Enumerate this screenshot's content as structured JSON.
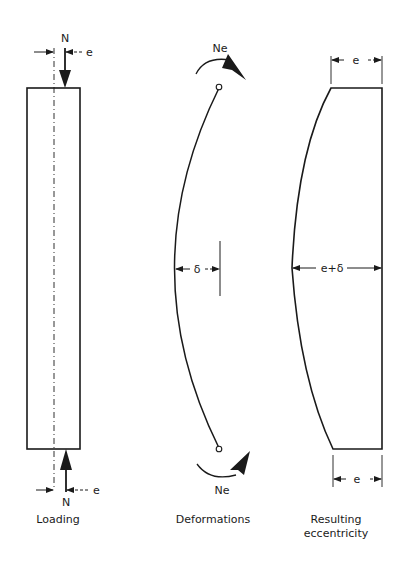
{
  "diagram": {
    "colors": {
      "ink": "#1a1a1a",
      "background": "#ffffff"
    },
    "panels": [
      {
        "id": "loading",
        "caption": "Loading",
        "top_force_label": "N",
        "top_eccentricity_label": "e",
        "bottom_force_label": "N",
        "bottom_eccentricity_label": "e"
      },
      {
        "id": "deformations",
        "caption": "Deformations",
        "top_moment_label": "Ne",
        "bottom_moment_label": "Ne",
        "deflection_label": "δ"
      },
      {
        "id": "resulting-eccentricity",
        "caption_line1": "Resulting",
        "caption_line2": "eccentricity",
        "top_dimension_label": "e",
        "mid_dimension_label": "e+δ",
        "bottom_dimension_label": "e"
      }
    ]
  }
}
